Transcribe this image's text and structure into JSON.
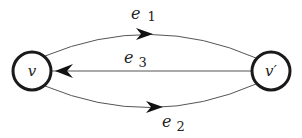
{
  "diagram": {
    "type": "directed-multigraph",
    "nodes": [
      {
        "id": "v",
        "label": "v",
        "cx": 32,
        "cy": 71,
        "r": 20
      },
      {
        "id": "v_prime",
        "label": "v′",
        "cx": 271,
        "cy": 71,
        "r": 20
      }
    ],
    "edges": [
      {
        "id": "e1",
        "label": "e",
        "subscript": "1",
        "from": "v",
        "to": "v_prime",
        "shape": "upper-arc"
      },
      {
        "id": "e2",
        "label": "e",
        "subscript": "2",
        "from": "v",
        "to": "v_prime",
        "shape": "lower-arc"
      },
      {
        "id": "e3",
        "label": "e",
        "subscript": "3",
        "from": "v_prime",
        "to": "v",
        "shape": "straight"
      }
    ],
    "colors": {
      "node_stroke": "#1a1a1a",
      "edge_stroke": "#555555",
      "arrow_fill": "#111111",
      "background": "#ffffff"
    }
  }
}
